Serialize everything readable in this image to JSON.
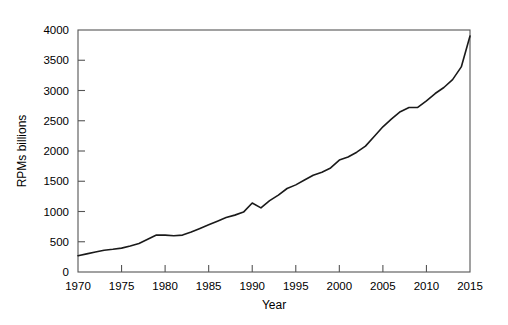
{
  "chart_data": {
    "type": "line",
    "title": "",
    "xlabel": "Year",
    "ylabel": "RPMs billions",
    "xlim": [
      1970,
      2015
    ],
    "ylim": [
      0,
      4000
    ],
    "xticks": [
      1970,
      1975,
      1980,
      1985,
      1990,
      1995,
      2000,
      2005,
      2010,
      2015
    ],
    "yticks": [
      0,
      500,
      1000,
      1500,
      2000,
      2500,
      3000,
      3500,
      4000
    ],
    "xtick_labels": [
      "1970",
      "1975",
      "1980",
      "1985",
      "1990",
      "1995",
      "2000",
      "2005",
      "2010",
      "2015"
    ],
    "ytick_labels": [
      "0",
      "500",
      "1000",
      "1500",
      "2000",
      "2500",
      "3000",
      "3500",
      "4000"
    ],
    "grid": false,
    "legend": null,
    "legend_position": "none",
    "line_color": "#1a1a1a",
    "line_width": 1.6,
    "frame": true,
    "series": [
      {
        "name": "RPMs billions",
        "x": [
          1970,
          1971,
          1972,
          1973,
          1974,
          1975,
          1976,
          1977,
          1978,
          1979,
          1980,
          1981,
          1982,
          1983,
          1984,
          1985,
          1986,
          1987,
          1988,
          1989,
          1990,
          1991,
          1992,
          1993,
          1994,
          1995,
          1996,
          1997,
          1998,
          1999,
          2000,
          2001,
          2002,
          2003,
          2004,
          2005,
          2006,
          2007,
          2008,
          2009,
          2010,
          2011,
          2012,
          2013,
          2014,
          2015
        ],
        "values": [
          270,
          300,
          330,
          360,
          375,
          395,
          430,
          470,
          540,
          610,
          610,
          600,
          610,
          660,
          720,
          780,
          840,
          900,
          940,
          990,
          1140,
          1060,
          1180,
          1270,
          1380,
          1440,
          1520,
          1600,
          1650,
          1720,
          1850,
          1900,
          1980,
          2080,
          2240,
          2400,
          2530,
          2650,
          2720,
          2720,
          2830,
          2950,
          3050,
          3180,
          3390,
          3900
        ]
      }
    ]
  },
  "axis": {
    "ylabel_text": "RPMs billions",
    "xlabel_text": "Year"
  }
}
